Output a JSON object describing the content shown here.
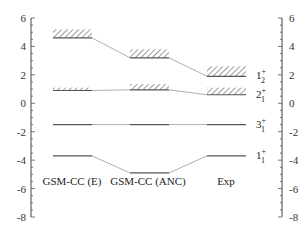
{
  "chart_data": {
    "type": "level-scheme",
    "title": "",
    "xlabel": "",
    "ylabel": "",
    "ylim": [
      -8,
      6
    ],
    "yticks": [
      -8,
      -6,
      -4,
      -2,
      0,
      2,
      4,
      6
    ],
    "grid": false,
    "columns": [
      "GSM-CC (E)",
      "GSM-CC (ANC)",
      "Exp"
    ],
    "levels": [
      {
        "state": "1_2^+",
        "label_main": "1",
        "label_sub": "2",
        "label_sup": "+",
        "energies": [
          4.6,
          3.2,
          1.9
        ],
        "widths": [
          0.6,
          0.6,
          0.7
        ]
      },
      {
        "state": "2_1^+",
        "label_main": "2",
        "label_sub": "1",
        "label_sup": "+",
        "energies": [
          0.9,
          0.95,
          0.6
        ],
        "widths": [
          0.2,
          0.4,
          0.5
        ]
      },
      {
        "state": "3_1^+",
        "label_main": "3",
        "label_sub": "1",
        "label_sup": "+",
        "energies": [
          -1.5,
          -1.5,
          -1.5
        ],
        "widths": [
          0,
          0,
          0
        ]
      },
      {
        "state": "1_1^+",
        "label_main": "1",
        "label_sub": "1",
        "label_sup": "+",
        "energies": [
          -3.7,
          -4.9,
          -3.7
        ],
        "widths": [
          0,
          0,
          0
        ]
      }
    ]
  },
  "axis": {
    "left_ticks": [
      "6",
      "4",
      "2",
      "0",
      "-2",
      "-4",
      "-6",
      "-8"
    ],
    "right_ticks": [
      "6",
      "4",
      "2",
      "0",
      "-2",
      "-4",
      "-6",
      "-8"
    ]
  },
  "labels": {
    "col0": "GSM-CC (E)",
    "col1": "GSM-CC (ANC)",
    "col2": "Exp"
  }
}
